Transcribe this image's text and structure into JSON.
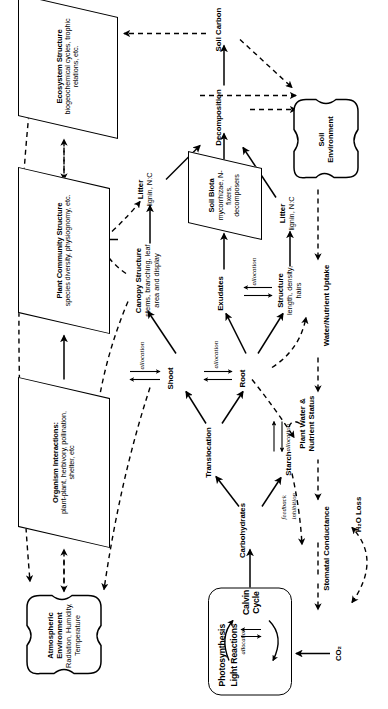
{
  "figure": {
    "orientation": "rotated-90-ccw",
    "colors": {
      "stroke": "#000000",
      "background": "#ffffff"
    }
  },
  "nodes": {
    "atmospheric_environment": {
      "title": "Atmospheric Environment",
      "subtitle": "Radiation, Humidity, Temperature",
      "shape": "blob"
    },
    "organism_interactions": {
      "title": "Organism Interactions:",
      "subtitle": "plant-plant, herbivory, pollination, shelter, etc",
      "shape": "parallelogram"
    },
    "plant_community_structure": {
      "title": "Plant Community Structure",
      "subtitle": "species diversity, physiognomy, etc.",
      "shape": "parallelogram"
    },
    "ecosystem_structure": {
      "title": "Ecosystem Structure",
      "subtitle": "biogeochemical cycles, trophic relations, etc.",
      "shape": "parallelogram"
    },
    "soil_biota": {
      "title": "Soil Biota",
      "subtitle": "mycorrhizae, N-fixers, decomposers",
      "shape": "parallelogram"
    },
    "photosynthesis": {
      "title": "Photosynthesis",
      "line1": "Light Reactions",
      "line2": "Calvin Cycle",
      "cycle_label": "allocation",
      "shape": "rounded-rect"
    },
    "soil_environment": {
      "title": "Soil Environment",
      "shape": "blob"
    },
    "canopy_structure": {
      "title": "Canopy Structure",
      "subtitle": "stems, branching, leaf area and display"
    },
    "leaf_litter": {
      "title": "Litter",
      "subtitle": "lignin, N:C"
    },
    "root_litter": {
      "title": "Litter",
      "subtitle": "lignin, N:C"
    },
    "root_structure": {
      "title": "Structure",
      "subtitle": "length, density, hairs"
    },
    "carbohydrates": {
      "title": "Carbohydrates"
    },
    "starch": {
      "title": "Starch"
    },
    "translocation": {
      "title": "Translocation"
    },
    "shoot": {
      "title": "Shoot"
    },
    "root": {
      "title": "Root"
    },
    "exudates": {
      "title": "Exudates"
    },
    "decomposition": {
      "title": "Decomposition"
    },
    "soil_carbon": {
      "title": "Soil Carbon"
    },
    "stomatal_conductance": {
      "title": "Stomatal Conductance"
    },
    "plant_water_status": {
      "title": "Plant Water & Nutrient Status"
    },
    "water_nutrient_uptake": {
      "title": "Water/Nutrient Uptake"
    },
    "co2": {
      "title": "CO₂"
    },
    "h2o_loss": {
      "title": "H₂O Loss"
    }
  },
  "edge_labels": {
    "shoot_allocation": "allocation",
    "starch_allocation": "allocation",
    "root_allocation": "allocation",
    "exudates_allocation": "allocation",
    "structure_allocation": "allocation",
    "feedback": "feedback",
    "inhibition": "inhibition"
  }
}
